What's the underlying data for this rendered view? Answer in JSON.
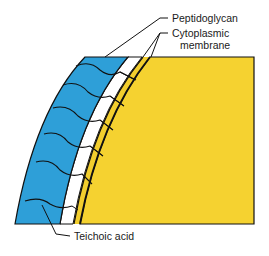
{
  "diagram": {
    "colors": {
      "cell_wall_peptidoglycan": "#2E9FD8",
      "periplasm": "#FFFFFF",
      "membrane": "#F2CE2E",
      "cytoplasm": "#F5D230",
      "outline": "#111111"
    },
    "labels": {
      "peptidoglycan": "Peptidoglycan",
      "cytoplasmic_line1": "Cytoplasmic",
      "cytoplasmic_line2": "membrane",
      "teichoic_acid": "Teichoic acid"
    }
  }
}
